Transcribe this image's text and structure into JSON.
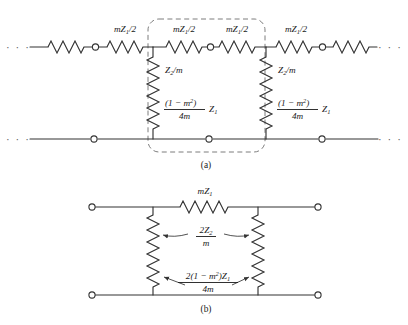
{
  "figure": {
    "background_color": "#ffffff",
    "line_color": "#333333",
    "dashed_box_color": "#7d7d7d",
    "panels": [
      {
        "id": "a",
        "caption": "(a)",
        "description": "Infinite ladder network of cascaded m-derived T-sections",
        "ellipsis_left": "· · ·",
        "ellipsis_right": "· · ·",
        "series_labels": [
          {
            "id": "series-1",
            "base": "mZ",
            "subscript": "1",
            "divisor": "/2",
            "full": "mZ1/2"
          },
          {
            "id": "series-2",
            "base": "mZ",
            "subscript": "1",
            "divisor": "/2",
            "full": "mZ1/2"
          },
          {
            "id": "series-3",
            "base": "mZ",
            "subscript": "1",
            "divisor": "/2",
            "full": "mZ1/2"
          },
          {
            "id": "series-4",
            "base": "mZ",
            "subscript": "1",
            "divisor": "/2",
            "full": "mZ1/2"
          }
        ],
        "shunt_labels": [
          {
            "id": "shunt-upper-left",
            "base": "Z",
            "subscript": "2",
            "divisor": "/m",
            "full": "Z2/m"
          },
          {
            "id": "shunt-upper-right",
            "base": "Z",
            "subscript": "2",
            "divisor": "/m",
            "full": "Z2/m"
          }
        ],
        "shunt_fraction_labels": [
          {
            "id": "shunt-lower-left",
            "numerator_open": "(1 − m",
            "numerator_exp": "2",
            "numerator_close": ")",
            "denominator": "4m",
            "trailing_base": "Z",
            "trailing_sub": "1",
            "full": "(1 − m²)/4m · Z1"
          },
          {
            "id": "shunt-lower-right",
            "numerator_open": "(1 − m",
            "numerator_exp": "2",
            "numerator_close": ")",
            "denominator": "4m",
            "trailing_base": "Z",
            "trailing_sub": "1",
            "full": "(1 − m²)/4m · Z1"
          }
        ]
      },
      {
        "id": "b",
        "caption": "(b)",
        "description": "Single equivalent T-section with series and shunt arms",
        "series_label": {
          "id": "series-mz1",
          "base": "mZ",
          "subscript": "1",
          "full": "mZ1"
        },
        "shunt_label_upper": {
          "id": "shunt-2z2-over-m",
          "numerator_base": "2Z",
          "numerator_sub": "2",
          "denominator": "m",
          "full": "2Z2/m"
        },
        "shunt_label_lower": {
          "id": "shunt-2-1-m2-z1-over-4m",
          "numerator_open": "2(1 − m",
          "numerator_exp": "2",
          "numerator_close": ")Z",
          "numerator_sub": "1",
          "denominator": "4m",
          "full": "2(1 − m²)Z1/4m"
        }
      }
    ]
  }
}
